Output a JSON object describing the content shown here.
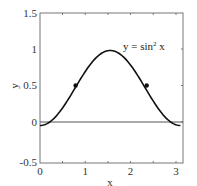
{
  "chart_data": {
    "type": "line",
    "title": "",
    "xlabel": "x",
    "ylabel": "y",
    "xlim": [
      0,
      3.2
    ],
    "ylim": [
      -0.5,
      1.5
    ],
    "xticks": [
      "0",
      "1",
      "2",
      "3"
    ],
    "yticks": [
      "-0.5",
      "0",
      "0.5",
      "1",
      "1.5"
    ],
    "grid": false,
    "legend": null,
    "series": [
      {
        "name": "y = sin² x",
        "function": "sin(x)^2",
        "x_range": [
          0,
          3.14159
        ],
        "color": "#111111"
      },
      {
        "name": "y = 0",
        "function": "0",
        "x_range": [
          0,
          3.2
        ],
        "color": "#555555"
      }
    ],
    "points": [
      {
        "x": 0.785,
        "y": 0.5,
        "label": "inflection point"
      },
      {
        "x": 2.356,
        "y": 0.5,
        "label": "inflection point"
      }
    ],
    "annotations": [
      {
        "text": "y = sin² x",
        "x": 1.75,
        "y": 1.02
      }
    ]
  },
  "labels": {
    "x_axis": "x",
    "y_axis": "y",
    "annotation_prefix": "y = sin",
    "annotation_sup": "2",
    "annotation_suffix": " x",
    "xt0": "0",
    "xt1": "1",
    "xt2": "2",
    "xt3": "3",
    "yt0": "-0.5",
    "yt1": "0",
    "yt2": "0.5",
    "yt3": "1",
    "yt4": "1.5"
  }
}
